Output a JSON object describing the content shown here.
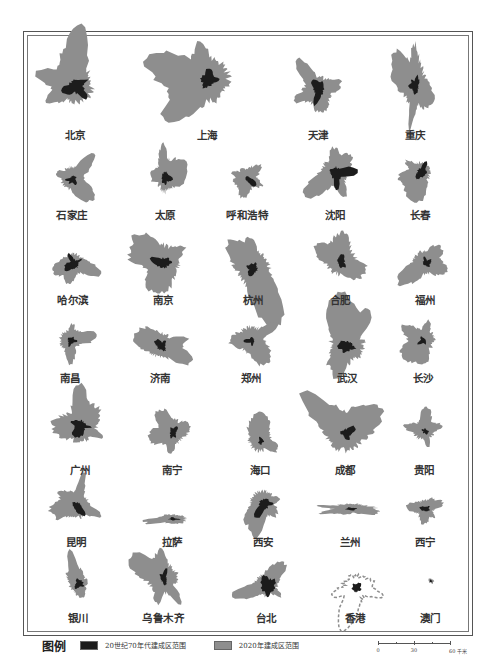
{
  "figure": {
    "colors": {
      "built_1970s": "#1c1c1c",
      "built_2020": "#8e8e8e",
      "frame": "#555555",
      "background": "#ffffff"
    },
    "cities": [
      {
        "name": "北京",
        "row": 0,
        "col": 0,
        "cx": 75,
        "cy": 85,
        "r": 32,
        "core": 11,
        "seed": 1
      },
      {
        "name": "上海",
        "row": 0,
        "col": 1,
        "cx": 207,
        "cy": 80,
        "r": 40,
        "core": 9,
        "seed": 2
      },
      {
        "name": "天津",
        "row": 0,
        "col": 2,
        "cx": 318,
        "cy": 90,
        "r": 24,
        "core": 8,
        "seed": 3
      },
      {
        "name": "重庆",
        "row": 0,
        "col": 3,
        "cx": 415,
        "cy": 85,
        "r": 18,
        "core": 6,
        "seed": 4,
        "elong": 2.4
      },
      {
        "name": "石家庄",
        "row": 1,
        "col": 0,
        "cx": 72,
        "cy": 178,
        "r": 20,
        "core": 5,
        "seed": 5
      },
      {
        "name": "太原",
        "row": 1,
        "col": 1,
        "cx": 165,
        "cy": 175,
        "r": 14,
        "core": 5,
        "seed": 6,
        "elong": 2.2
      },
      {
        "name": "呼和浩特",
        "row": 1,
        "col": 2,
        "cx": 247,
        "cy": 178,
        "r": 18,
        "core": 4,
        "seed": 7
      },
      {
        "name": "沈阳",
        "row": 1,
        "col": 3,
        "cx": 335,
        "cy": 172,
        "r": 24,
        "core": 10,
        "seed": 8
      },
      {
        "name": "长春",
        "row": 1,
        "col": 4,
        "cx": 420,
        "cy": 172,
        "r": 18,
        "core": 7,
        "seed": 9
      },
      {
        "name": "哈尔滨",
        "row": 2,
        "col": 0,
        "cx": 73,
        "cy": 263,
        "r": 18,
        "core": 8,
        "seed": 10
      },
      {
        "name": "南京",
        "row": 2,
        "col": 1,
        "cx": 163,
        "cy": 262,
        "r": 30,
        "core": 8,
        "seed": 11
      },
      {
        "name": "杭州",
        "row": 2,
        "col": 2,
        "cx": 253,
        "cy": 268,
        "r": 30,
        "core": 6,
        "seed": 12
      },
      {
        "name": "合肥",
        "row": 2,
        "col": 3,
        "cx": 340,
        "cy": 260,
        "r": 26,
        "core": 6,
        "seed": 13
      },
      {
        "name": "福州",
        "row": 2,
        "col": 4,
        "cx": 425,
        "cy": 262,
        "r": 20,
        "core": 5,
        "seed": 14
      },
      {
        "name": "南昌",
        "row": 3,
        "col": 0,
        "cx": 70,
        "cy": 340,
        "r": 18,
        "core": 5,
        "seed": 15
      },
      {
        "name": "济南",
        "row": 3,
        "col": 1,
        "cx": 160,
        "cy": 345,
        "r": 22,
        "core": 6,
        "seed": 16
      },
      {
        "name": "郑州",
        "row": 3,
        "col": 2,
        "cx": 251,
        "cy": 340,
        "r": 24,
        "core": 4,
        "seed": 17
      },
      {
        "name": "武汉",
        "row": 3,
        "col": 3,
        "cx": 347,
        "cy": 345,
        "r": 30,
        "core": 8,
        "seed": 18
      },
      {
        "name": "长沙",
        "row": 3,
        "col": 4,
        "cx": 423,
        "cy": 340,
        "r": 20,
        "core": 4,
        "seed": 19
      },
      {
        "name": "广州",
        "row": 4,
        "col": 0,
        "cx": 80,
        "cy": 425,
        "r": 30,
        "core": 9,
        "seed": 20
      },
      {
        "name": "南宁",
        "row": 4,
        "col": 1,
        "cx": 172,
        "cy": 432,
        "r": 22,
        "core": 5,
        "seed": 21
      },
      {
        "name": "海口",
        "row": 4,
        "col": 2,
        "cx": 260,
        "cy": 440,
        "r": 20,
        "core": 3,
        "seed": 22
      },
      {
        "name": "成都",
        "row": 4,
        "col": 3,
        "cx": 345,
        "cy": 432,
        "r": 34,
        "core": 7,
        "seed": 23
      },
      {
        "name": "贵阳",
        "row": 4,
        "col": 4,
        "cx": 424,
        "cy": 430,
        "r": 18,
        "core": 3,
        "seed": 24
      },
      {
        "name": "昆明",
        "row": 5,
        "col": 0,
        "cx": 76,
        "cy": 505,
        "r": 24,
        "core": 6,
        "seed": 25
      },
      {
        "name": "拉萨",
        "row": 5,
        "col": 1,
        "cx": 172,
        "cy": 518,
        "r": 18,
        "core": 4,
        "seed": 26,
        "flat": 0.35
      },
      {
        "name": "西安",
        "row": 5,
        "col": 2,
        "cx": 263,
        "cy": 503,
        "r": 22,
        "core": 8,
        "seed": 27
      },
      {
        "name": "兰州",
        "row": 5,
        "col": 3,
        "cx": 350,
        "cy": 508,
        "r": 22,
        "core": 5,
        "seed": 28,
        "flat": 0.35
      },
      {
        "name": "西宁",
        "row": 5,
        "col": 4,
        "cx": 425,
        "cy": 508,
        "r": 14,
        "core": 4,
        "seed": 29
      },
      {
        "name": "银川",
        "row": 6,
        "col": 0,
        "cx": 78,
        "cy": 583,
        "r": 16,
        "core": 5,
        "seed": 30
      },
      {
        "name": "乌鲁木齐",
        "row": 6,
        "col": 1,
        "cx": 163,
        "cy": 578,
        "r": 26,
        "core": 5,
        "seed": 31
      },
      {
        "name": "台北",
        "row": 6,
        "col": 2,
        "cx": 266,
        "cy": 585,
        "r": 20,
        "core": 10,
        "seed": 32
      },
      {
        "name": "香港",
        "row": 6,
        "col": 3,
        "cx": 355,
        "cy": 588,
        "r": 22,
        "core": 5,
        "seed": 33,
        "sparse": true
      },
      {
        "name": "澳门",
        "row": 6,
        "col": 4,
        "cx": 430,
        "cy": 580,
        "r": 3,
        "core": 1.5,
        "seed": 34
      }
    ],
    "label_rows_y": [
      133,
      213,
      298,
      376,
      468,
      540,
      616
    ]
  },
  "legend": {
    "title": "图例",
    "items": [
      {
        "label": "20世纪70年代建成区范围",
        "swatch": "dark"
      },
      {
        "label": "2020年建成区范围",
        "swatch": "gray"
      }
    ]
  },
  "scale_bar": {
    "ticks": [
      "0",
      "30",
      "60 千米"
    ]
  }
}
